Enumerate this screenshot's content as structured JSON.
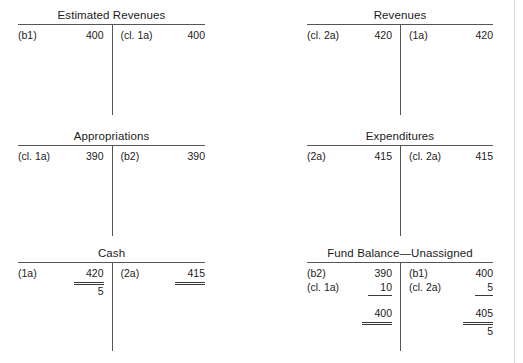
{
  "page": {
    "type": "t-account-ledger",
    "accounts": [
      {
        "name": "estimated-revenues",
        "title": "Estimated Revenues",
        "debit": [
          {
            "ref": "(b1)",
            "amount": "400"
          }
        ],
        "credit": [
          {
            "ref": "(cl. 1a)",
            "amount": "400"
          }
        ]
      },
      {
        "name": "revenues",
        "title": "Revenues",
        "debit": [
          {
            "ref": "(cl. 2a)",
            "amount": "420"
          }
        ],
        "credit": [
          {
            "ref": "(1a)",
            "amount": "420"
          }
        ]
      },
      {
        "name": "appropriations",
        "title": "Appropriations",
        "debit": [
          {
            "ref": "(cl. 1a)",
            "amount": "390"
          }
        ],
        "credit": [
          {
            "ref": "(b2)",
            "amount": "390"
          }
        ]
      },
      {
        "name": "expenditures",
        "title": "Expenditures",
        "debit": [
          {
            "ref": "(2a)",
            "amount": "415"
          }
        ],
        "credit": [
          {
            "ref": "(cl. 2a)",
            "amount": "415"
          }
        ]
      },
      {
        "name": "cash",
        "title": "Cash",
        "debit": [
          {
            "ref": "(1a)",
            "amount": "420"
          }
        ],
        "debit_balance": "5",
        "credit": [
          {
            "ref": "(2a)",
            "amount": "415"
          }
        ]
      },
      {
        "name": "fund-balance-unassigned",
        "title": "Fund Balance—Unassigned",
        "debit": [
          {
            "ref": "(b2)",
            "amount": "390"
          },
          {
            "ref": "(cl. 1a)",
            "amount": "10"
          }
        ],
        "debit_total": "400",
        "credit": [
          {
            "ref": "(b1)",
            "amount": "400"
          },
          {
            "ref": "(cl. 2a)",
            "amount": "5"
          }
        ],
        "credit_total": "405",
        "credit_balance": "5"
      }
    ]
  }
}
